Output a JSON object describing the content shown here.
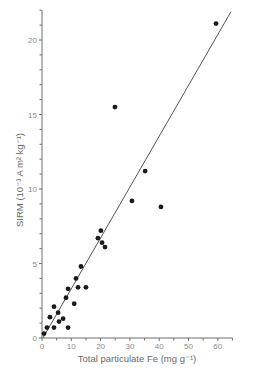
{
  "chart_data": {
    "type": "scatter",
    "title": "",
    "xlabel": "Total particulate Fe (mg g⁻¹)",
    "ylabel": "SIRM (10⁻³ A m² kg⁻¹)",
    "xlim": [
      0,
      65
    ],
    "ylim": [
      0,
      22
    ],
    "xticks": [
      0,
      10,
      20,
      30,
      40,
      50,
      60
    ],
    "yticks": [
      0,
      5,
      10,
      15,
      20
    ],
    "grid": false,
    "legend": null,
    "series": [
      {
        "name": "samples",
        "marker": "filled-circle",
        "color": "#1a1a1a",
        "points": [
          [
            0.7,
            0.3
          ],
          [
            1.7,
            0.7
          ],
          [
            2.7,
            1.4
          ],
          [
            4.1,
            2.1
          ],
          [
            4.1,
            0.7
          ],
          [
            5.5,
            1.7
          ],
          [
            5.8,
            1.1
          ],
          [
            7.2,
            1.3
          ],
          [
            8.2,
            2.7
          ],
          [
            8.9,
            3.3
          ],
          [
            8.9,
            0.7
          ],
          [
            11.0,
            2.3
          ],
          [
            11.6,
            4.0
          ],
          [
            12.3,
            3.4
          ],
          [
            13.3,
            4.8
          ],
          [
            15.0,
            3.4
          ],
          [
            19.1,
            6.7
          ],
          [
            20.1,
            7.2
          ],
          [
            20.5,
            6.4
          ],
          [
            21.5,
            6.1
          ],
          [
            24.9,
            15.5
          ],
          [
            30.7,
            9.2
          ],
          [
            35.2,
            11.2
          ],
          [
            40.6,
            8.8
          ],
          [
            59.4,
            21.1
          ]
        ]
      }
    ],
    "fit_line": {
      "name": "regression",
      "color": "#555555",
      "from": [
        0.3,
        0.0
      ],
      "to": [
        64.5,
        21.9
      ]
    }
  },
  "labels": {
    "x_title": "Total particulate Fe (mg g⁻¹)",
    "y_title": "SIRM (10⁻³ A m² kg⁻¹)"
  }
}
